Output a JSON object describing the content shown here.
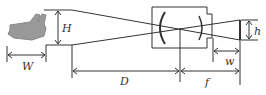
{
  "diagram": {
    "labels": {
      "H": "H",
      "W": "W",
      "D": "D",
      "f": "f",
      "w": "w",
      "h": "h"
    },
    "objects": [
      "hand",
      "camera-body",
      "lens",
      "sensor"
    ],
    "colors": {
      "line": "#333333",
      "hand": "#999999"
    }
  }
}
